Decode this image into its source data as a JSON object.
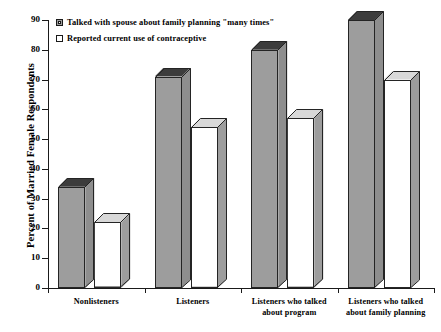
{
  "chart_data": {
    "type": "bar",
    "title": "",
    "xlabel": "",
    "ylabel": "Percent of Married Female Respondents",
    "ylim": [
      0,
      90
    ],
    "ytick_labels": [
      "0",
      "10",
      "20",
      "30",
      "40",
      "50",
      "60",
      "70",
      "80",
      "90"
    ],
    "ytick_values": [
      0,
      10,
      20,
      30,
      40,
      50,
      60,
      70,
      80,
      90
    ],
    "grid": false,
    "legend_position": "top-left",
    "categories": [
      "Nonlisteners",
      "Listeners",
      "Listeners who talked about program",
      "Listeners who talked about family planning"
    ],
    "category_lines": [
      [
        "Nonlisteners"
      ],
      [
        "Listeners"
      ],
      [
        "Listeners who talked",
        "about program"
      ],
      [
        "Listeners who talked",
        "about family planning"
      ]
    ],
    "series": [
      {
        "name": "Talked with spouse about family planning \"many times\"",
        "values": [
          34,
          71,
          80,
          90
        ],
        "color": "#9d9d9d"
      },
      {
        "name": "Reported current use of contraceptive",
        "values": [
          22,
          54,
          57,
          70
        ],
        "color": "#ffffff"
      }
    ]
  },
  "legend": {
    "items": [
      {
        "label": "Talked with spouse about family planning \"many times\"",
        "swatch": "filled"
      },
      {
        "label": "Reported current use of contraceptive",
        "swatch": "hollow"
      }
    ]
  },
  "axes": {
    "y_title": "Percent of Married Female Respondents"
  }
}
